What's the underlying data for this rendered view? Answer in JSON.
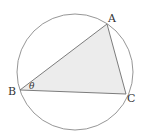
{
  "diagram": {
    "circle": {
      "cx": 75,
      "cy": 72,
      "r": 58,
      "stroke": "#8a8a8a"
    },
    "triangle": {
      "fill": "#ececec",
      "stroke": "#6e6e6e",
      "vertices": {
        "A": {
          "x": 107,
          "y": 24
        },
        "B": {
          "x": 20,
          "y": 90
        },
        "C": {
          "x": 126,
          "y": 94
        }
      }
    },
    "labels": {
      "A": "A",
      "B": "B",
      "C": "C",
      "angle": "θ"
    }
  }
}
